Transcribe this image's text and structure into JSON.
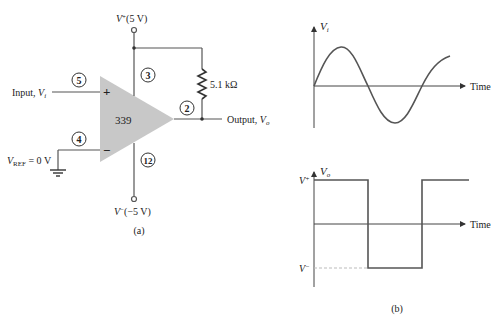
{
  "circuit": {
    "chip_label": "339",
    "supply_pos_label": "V",
    "supply_pos_sup": "+",
    "supply_pos_value": "(5 V)",
    "supply_neg_label": "V",
    "supply_neg_sup": "−",
    "supply_neg_value": "(−5 V)",
    "input_label": "Input, ",
    "input_var": "V",
    "input_sub": "i",
    "vref_var": "V",
    "vref_sub": "REF",
    "vref_value": " = 0 V",
    "output_label": "Output, ",
    "output_var": "V",
    "output_sub": "o",
    "resistor_label": "5.1 kΩ",
    "plus_sign": "+",
    "minus_sign": "−",
    "pins": {
      "noninv": "5",
      "inv": "4",
      "vpos": "3",
      "vneg": "12",
      "out": "2"
    },
    "caption": "(a)"
  },
  "waveforms": {
    "caption": "(b)",
    "input_plot": {
      "ylabel_var": "V",
      "ylabel_sub": "i",
      "xlabel": "Time"
    },
    "output_plot": {
      "ylabel_var": "V",
      "ylabel_sub": "o",
      "xlabel": "Time",
      "high_label": "V",
      "high_sup": "+",
      "low_label": "V",
      "low_sup": "−"
    }
  },
  "colors": {
    "line": "#555555",
    "opamp_fill": "#c8c8c8",
    "dashed": "#bbbbbb"
  }
}
